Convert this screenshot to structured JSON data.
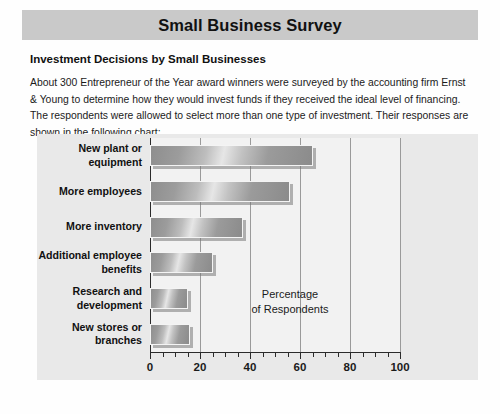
{
  "banner": {
    "title": "Small Business Survey"
  },
  "subtitle": "Investment Decisions by Small Businesses",
  "body_text": "About 300 Entrepreneur of the Year award winners were surveyed by the accounting firm Ernst & Young to determine how they would invest funds if they received the ideal level of financing. The respondents were allowed to select more than one type of investment. Their responses are shown in the following chart:",
  "chart_data": {
    "type": "bar",
    "orientation": "horizontal",
    "title": "",
    "xlabel": "Percentage\nof Respondents",
    "ylabel": "",
    "xlim": [
      0,
      100
    ],
    "grid": true,
    "legend": "none",
    "categories": [
      "New plant or\nequipment",
      "More employees",
      "More inventory",
      "Additional employee\nbenefits",
      "Research and\ndevelopment",
      "New stores or\nbranches"
    ],
    "values": [
      65,
      56,
      37,
      25,
      15,
      16
    ],
    "xticks": [
      0,
      20,
      40,
      60,
      80,
      100
    ],
    "xtick_labels": [
      "0",
      "20",
      "40",
      "60",
      "80",
      "100"
    ],
    "minor_tick_step": 5,
    "annotation": "Percentage\nof Respondents"
  },
  "colors": {
    "banner_bg": "#c9c9c9",
    "panel_bg": "#e9e9e9",
    "plot_bg": "#f2f2f2",
    "axis": "#2b2b2b",
    "grid": "#9a9a9a",
    "bar_light": "#e6e6e6",
    "bar_dark": "#8b8b8b",
    "text": "#111111"
  }
}
